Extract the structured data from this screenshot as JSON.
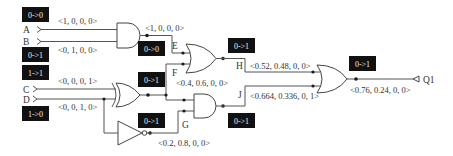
{
  "inputs": {
    "A": {
      "label": "A",
      "transition": "0->0",
      "vector": "<1, 0, 0, 0>"
    },
    "B": {
      "label": "B",
      "transition": "0->1",
      "vector": "<0, 1, 0, 0>"
    },
    "C": {
      "label": "C",
      "transition": "1->1",
      "vector": "<0, 0, 0, 1>"
    },
    "D": {
      "label": "D",
      "transition": "1->0",
      "vector": "<0, 0, 1, 0>"
    }
  },
  "nets": {
    "E": {
      "label": "E",
      "transition": "0->0",
      "vector": "<1, 0, 0, 0>"
    },
    "F": {
      "label": "F",
      "transition": "0->1",
      "vector": "<0.4, 0.6, 0, 0>"
    },
    "G": {
      "label": "G",
      "transition": "0->1",
      "vector": "<0.2, 0.8, 0, 0>"
    },
    "H": {
      "label": "H",
      "transition": "0->1",
      "vector": "<0.52, 0.48, 0, 0>"
    },
    "J": {
      "label": "J",
      "transition": "0->1",
      "vector": "<0.664, 0.336, 0, 1>"
    }
  },
  "output": {
    "Q1": {
      "label": "Q1",
      "transition": "0->1",
      "vector": "<0.76, 0.24, 0, 0>"
    }
  },
  "gates": [
    {
      "id": "and1",
      "type": "AND"
    },
    {
      "id": "xor1",
      "type": "XOR"
    },
    {
      "id": "not1",
      "type": "NOT"
    },
    {
      "id": "or1",
      "type": "OR"
    },
    {
      "id": "and2",
      "type": "AND"
    },
    {
      "id": "or2",
      "type": "OR"
    }
  ]
}
